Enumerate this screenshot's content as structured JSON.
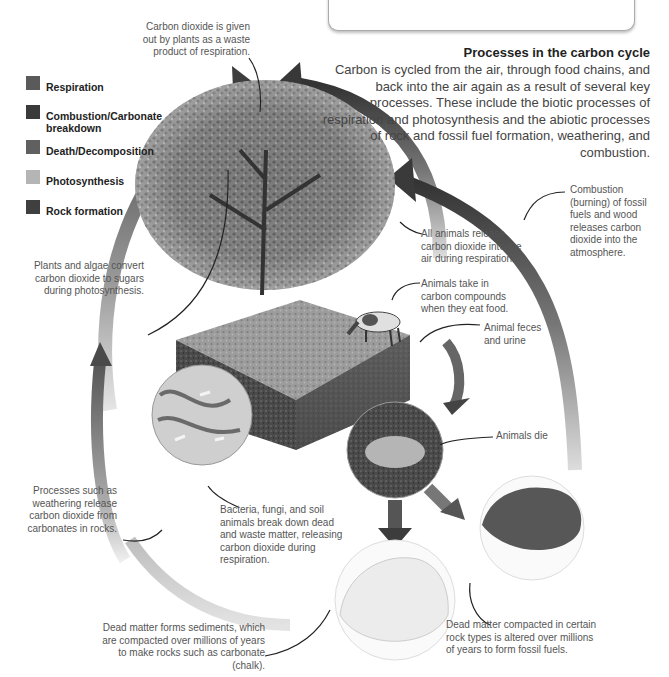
{
  "top_box": {
    "text": "dioxide to the air."
  },
  "legend": [
    {
      "label": "Respiration",
      "color": "#5a5a5a"
    },
    {
      "label": "Combustion/Carbonate breakdown",
      "color": "#3a3a3a"
    },
    {
      "label": "Death/Decomposition",
      "color": "#606060"
    },
    {
      "label": "Photosynthesis",
      "color": "#b5b5b5"
    },
    {
      "label": "Rock formation",
      "color": "#3f3f3f"
    }
  ],
  "section": {
    "heading": "Processes in the carbon cycle",
    "intro": "Carbon is cycled from the air, through food chains, and back into the air again as a result of several key processes. These include the biotic processes of respiration and photosynthesis and the abiotic processes of rock and fossil fuel formation, weathering, and combustion."
  },
  "captions": {
    "plant_respiration": "Carbon dioxide is given out by plants as a waste product of respiration.",
    "photosynthesis": "Plants and algae convert carbon dioxide to sugars during photosynthesis.",
    "animal_respiration": "All animals release carbon dioxide into the air during respiration.",
    "combustion": "Combustion (burning) of fossil fuels and wood releases carbon dioxide into the atmosphere.",
    "animals_eat": "Animals take in carbon compounds when they eat food.",
    "feces": "Animal feces and urine",
    "animals_die": "Animals die",
    "decomposers": "Bacteria, fungi, and soil animals break down dead and waste matter, releasing carbon dioxide during respiration.",
    "weathering": "Processes such as weathering release carbon dioxide from carbonates in rocks.",
    "sediments": "Dead matter forms sediments, which are compacted over millions of years to make rocks such as carbonate (chalk).",
    "fossil_fuels": "Dead matter compacted in certain rock types is altered over millions of years to form fossil fuels."
  }
}
